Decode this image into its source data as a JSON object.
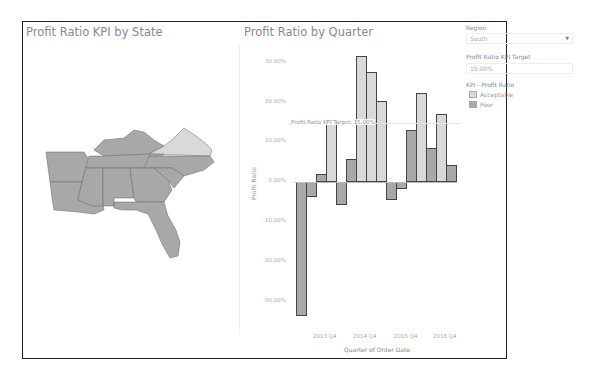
{
  "dashboard": {
    "map_title": "Profit Ratio KPI by State",
    "chart_title": "Profit Ratio by Quarter"
  },
  "filters": {
    "region_label": "Region",
    "region_value": "South",
    "target_label": "Profit Ratio KPI Target",
    "target_value": "15.00%",
    "legend_title": "KPI - Profit Ratio",
    "legend": [
      {
        "label": "Acceptable",
        "color": "#d9d9d9"
      },
      {
        "label": "Poor",
        "color": "#a8a8a8"
      }
    ]
  },
  "map": {
    "states_poor": [
      "Arkansas",
      "Louisiana",
      "Mississippi",
      "Alabama",
      "Georgia",
      "Florida",
      "Tennessee",
      "Kentucky",
      "North Carolina",
      "South Carolina"
    ],
    "states_acceptable": [
      "Virginia"
    ]
  },
  "chart_data": {
    "type": "bar",
    "title": "Profit Ratio by Quarter",
    "xlabel": "Quarter of Order Date",
    "ylabel": "Profit Ratio",
    "ylim": [
      -35,
      33
    ],
    "y_ticks": [
      "30.00%",
      "20.00%",
      "10.00%",
      "0.00%",
      "-10.00%",
      "-20.00%",
      "-30.00%"
    ],
    "x_tick_labels": [
      "2013 Q4",
      "2014 Q4",
      "2015 Q4",
      "2016 Q4"
    ],
    "categories": [
      "2013 Q1",
      "2013 Q2",
      "2013 Q3",
      "2013 Q4",
      "2014 Q1",
      "2014 Q2",
      "2014 Q3",
      "2014 Q4",
      "2015 Q1",
      "2015 Q2",
      "2015 Q3",
      "2015 Q4",
      "2016 Q1",
      "2016 Q2",
      "2016 Q3",
      "2016 Q4"
    ],
    "values": [
      -33.9,
      -3.8,
      2.0,
      15.7,
      -5.8,
      5.8,
      31.9,
      27.8,
      20.5,
      -4.6,
      -1.8,
      13.2,
      22.5,
      8.6,
      17.2,
      4.3
    ],
    "reference_line": {
      "value": 15.0,
      "label": "Profit Ratio KPI Target: 15.00%"
    },
    "color_rule": "Acceptable if >= target, else Poor",
    "colors": {
      "acceptable": "#d9d9d9",
      "poor": "#a8a8a8"
    },
    "grid": false,
    "legend_position": "right"
  }
}
